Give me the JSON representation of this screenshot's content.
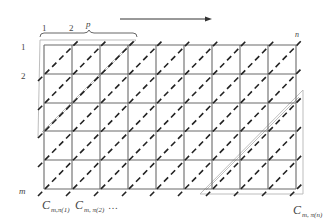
{
  "diagram": {
    "direction_arrow": {
      "label": ""
    },
    "top_labels": {
      "col1": "1",
      "col2": "2",
      "colp": "p",
      "coln": "n"
    },
    "left_labels": {
      "row1": "1",
      "row2": "2",
      "rowm": "m"
    },
    "bottom_labels": {
      "c1": "C",
      "c1_sub": "m,π(1)",
      "c2": "C",
      "c2_sub": "m, π(2)",
      "ellipsis": "…",
      "cn": "C",
      "cn_sub": "m, π(n)"
    },
    "grid": {
      "columns": 9,
      "rows": 5,
      "line_color": "#6a6a6a",
      "dash_color": "#222222",
      "band_color": "#b5b5b5"
    }
  }
}
